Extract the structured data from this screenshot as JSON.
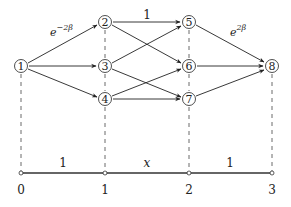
{
  "diagram": {
    "nodes": [
      {
        "id": "1",
        "label": "1",
        "x": 21,
        "y": 66
      },
      {
        "id": "2",
        "label": "2",
        "x": 105,
        "y": 22
      },
      {
        "id": "3",
        "label": "3",
        "x": 105,
        "y": 66
      },
      {
        "id": "4",
        "label": "4",
        "x": 105,
        "y": 99
      },
      {
        "id": "5",
        "label": "5",
        "x": 189,
        "y": 22
      },
      {
        "id": "6",
        "label": "6",
        "x": 189,
        "y": 66
      },
      {
        "id": "7",
        "label": "7",
        "x": 189,
        "y": 99
      },
      {
        "id": "8",
        "label": "8",
        "x": 272,
        "y": 66
      }
    ],
    "edges": [
      {
        "from": "1",
        "to": "2",
        "label": "e^{-2β}"
      },
      {
        "from": "1",
        "to": "3"
      },
      {
        "from": "1",
        "to": "4"
      },
      {
        "from": "2",
        "to": "5",
        "label": "1"
      },
      {
        "from": "2",
        "to": "6"
      },
      {
        "from": "3",
        "to": "5"
      },
      {
        "from": "3",
        "to": "7"
      },
      {
        "from": "4",
        "to": "6"
      },
      {
        "from": "4",
        "to": "7"
      },
      {
        "from": "5",
        "to": "8",
        "label": "e^{2β}"
      },
      {
        "from": "6",
        "to": "8"
      },
      {
        "from": "7",
        "to": "8"
      }
    ],
    "edge_labels": {
      "e12_base": "e",
      "e12_exp": "−2β",
      "e25": "1",
      "e58_base": "e",
      "e58_exp": "2β"
    },
    "axis": {
      "ticks": [
        {
          "label": "0",
          "x": 21
        },
        {
          "label": "1",
          "x": 105
        },
        {
          "label": "2",
          "x": 189
        },
        {
          "label": "3",
          "x": 272
        }
      ],
      "segment_labels": [
        {
          "label": "1",
          "x": 63
        },
        {
          "label": "x",
          "x": 147
        },
        {
          "label": "1",
          "x": 230
        }
      ]
    }
  }
}
